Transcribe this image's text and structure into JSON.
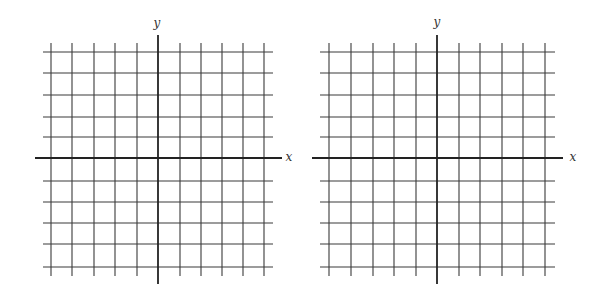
{
  "diagram": {
    "type": "coordinate-grids",
    "count": 2,
    "colors": {
      "grid": "#3a3a3a",
      "axis": "#222222",
      "background": "#ffffff"
    },
    "planes": [
      {
        "name": "left-plane",
        "x_label": "x",
        "y_label": "y",
        "origin": [
          158,
          158
        ],
        "x_gridlines": [
          51,
          72,
          94,
          115,
          137,
          180,
          201,
          222,
          243,
          264
        ],
        "y_gridlines": [
          52,
          73,
          95,
          117,
          137,
          181,
          202,
          223,
          244,
          267
        ],
        "grid_extent": {
          "x1": 43,
          "x2": 273,
          "y1": 43,
          "y2": 276
        },
        "axis_extent": {
          "x1": 35,
          "x2": 282,
          "y1": 35,
          "y2": 284
        },
        "label_pos": {
          "x": [
            289,
            161
          ],
          "y": [
            157,
            27
          ]
        }
      },
      {
        "name": "right-plane",
        "x_label": "x",
        "y_label": "y",
        "origin": [
          437,
          158
        ],
        "x_gridlines": [
          329,
          351,
          373,
          394,
          416,
          459,
          480,
          502,
          523,
          545
        ],
        "y_gridlines": [
          52,
          73,
          95,
          117,
          137,
          181,
          202,
          223,
          244,
          267
        ],
        "grid_extent": {
          "x1": 320,
          "x2": 555,
          "y1": 43,
          "y2": 276
        },
        "axis_extent": {
          "x1": 312,
          "x2": 563,
          "y1": 35,
          "y2": 284
        },
        "label_pos": {
          "x": [
            573,
            161
          ],
          "y": [
            437,
            26
          ]
        }
      }
    ]
  }
}
